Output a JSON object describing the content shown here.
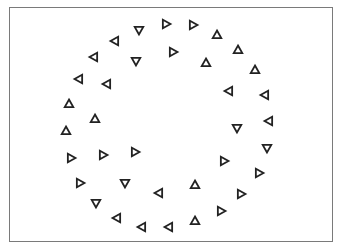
{
  "figure": {
    "stroke_color": "#222222",
    "frame_color": "#7a7a7a",
    "triangle_size": 9,
    "triangles": [
      {
        "x": 139,
        "y": 30,
        "dir": "down"
      },
      {
        "x": 166,
        "y": 24,
        "dir": "right"
      },
      {
        "x": 193,
        "y": 25,
        "dir": "right"
      },
      {
        "x": 217,
        "y": 35,
        "dir": "up"
      },
      {
        "x": 238,
        "y": 50,
        "dir": "up"
      },
      {
        "x": 115,
        "y": 41,
        "dir": "left"
      },
      {
        "x": 94,
        "y": 57,
        "dir": "left"
      },
      {
        "x": 136,
        "y": 61,
        "dir": "down"
      },
      {
        "x": 173,
        "y": 52,
        "dir": "right"
      },
      {
        "x": 206,
        "y": 63,
        "dir": "up"
      },
      {
        "x": 79,
        "y": 79,
        "dir": "left"
      },
      {
        "x": 107,
        "y": 84,
        "dir": "left"
      },
      {
        "x": 255,
        "y": 70,
        "dir": "up"
      },
      {
        "x": 229,
        "y": 91,
        "dir": "left"
      },
      {
        "x": 265,
        "y": 95,
        "dir": "left"
      },
      {
        "x": 69,
        "y": 104,
        "dir": "up"
      },
      {
        "x": 95,
        "y": 119,
        "dir": "up"
      },
      {
        "x": 237,
        "y": 128,
        "dir": "down"
      },
      {
        "x": 269,
        "y": 121,
        "dir": "left"
      },
      {
        "x": 66,
        "y": 131,
        "dir": "up"
      },
      {
        "x": 71,
        "y": 158,
        "dir": "right"
      },
      {
        "x": 103,
        "y": 155,
        "dir": "right"
      },
      {
        "x": 135,
        "y": 152,
        "dir": "right"
      },
      {
        "x": 267,
        "y": 148,
        "dir": "down"
      },
      {
        "x": 80,
        "y": 183,
        "dir": "right"
      },
      {
        "x": 125,
        "y": 183,
        "dir": "down"
      },
      {
        "x": 224,
        "y": 161,
        "dir": "right"
      },
      {
        "x": 259,
        "y": 173,
        "dir": "right"
      },
      {
        "x": 96,
        "y": 203,
        "dir": "down"
      },
      {
        "x": 159,
        "y": 193,
        "dir": "left"
      },
      {
        "x": 195,
        "y": 185,
        "dir": "up"
      },
      {
        "x": 241,
        "y": 194,
        "dir": "right"
      },
      {
        "x": 117,
        "y": 218,
        "dir": "left"
      },
      {
        "x": 142,
        "y": 227,
        "dir": "left"
      },
      {
        "x": 169,
        "y": 227,
        "dir": "left"
      },
      {
        "x": 195,
        "y": 221,
        "dir": "up"
      },
      {
        "x": 221,
        "y": 211,
        "dir": "right"
      }
    ]
  }
}
